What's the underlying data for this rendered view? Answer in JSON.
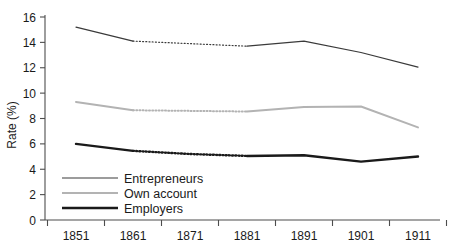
{
  "chart_data": {
    "type": "line",
    "title": "",
    "xlabel": "",
    "ylabel": "Rate (%)",
    "x": [
      1851,
      1861,
      1871,
      1881,
      1891,
      1901,
      1911
    ],
    "xtick_labels": [
      "1851",
      "1861",
      "1871",
      "1881",
      "1891",
      "1901",
      "1911"
    ],
    "ytick_labels": [
      "0",
      "2",
      "4",
      "6",
      "8",
      "10",
      "12",
      "14",
      "16"
    ],
    "yticks": [
      0,
      2,
      4,
      6,
      8,
      10,
      12,
      14,
      16
    ],
    "ylim": [
      0,
      16
    ],
    "grid": false,
    "legend_position": "lower-left",
    "series": [
      {
        "name": "Entrepreneurs",
        "color": "#3a3a3a",
        "width": 1.2,
        "values": [
          15.2,
          14.1,
          13.9,
          13.7,
          14.1,
          13.2,
          12.05
        ],
        "interpolated_span": [
          1861,
          1881
        ]
      },
      {
        "name": "Own account",
        "color": "#b3b3b3",
        "width": 2.0,
        "values": [
          9.3,
          8.65,
          8.6,
          8.55,
          8.9,
          8.95,
          7.3
        ],
        "interpolated_span": [
          1861,
          1881
        ]
      },
      {
        "name": "Employers",
        "color": "#1a1a1a",
        "width": 2.4,
        "values": [
          6.0,
          5.45,
          5.2,
          5.05,
          5.1,
          4.6,
          5.0
        ],
        "interpolated_span": [
          1861,
          1881
        ]
      }
    ]
  },
  "legend": {
    "items": [
      {
        "label": "Entrepreneurs"
      },
      {
        "label": "Own account"
      },
      {
        "label": "Employers"
      }
    ]
  }
}
